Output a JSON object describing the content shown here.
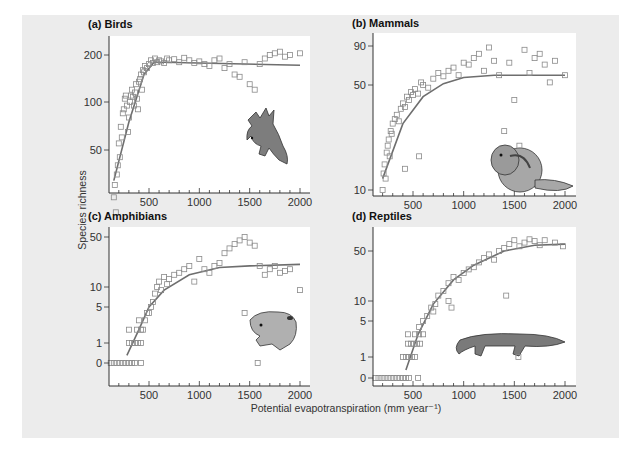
{
  "figure": {
    "ylabel": "Species richness",
    "xlabel": "Potential evapotranspiration (mm year⁻¹)",
    "background": "#ececec",
    "marker_color": "#8a8a8a",
    "fit_color": "#6e6e6e"
  },
  "chart_data": [
    {
      "type": "scatter",
      "title": "(a) Birds",
      "xlabel": "Potential evapotranspiration (mm year-1)",
      "ylabel": "Species richness",
      "x_ticks": [
        500,
        1000,
        1500,
        2000
      ],
      "y_ticks": [
        50,
        100,
        200
      ],
      "xlim": [
        100,
        2100
      ],
      "ylim_scale": "log",
      "grid": false,
      "illustration": "bird",
      "fit_line": {
        "x": [
          150,
          300,
          450,
          550,
          650,
          2000
        ],
        "y": [
          32,
          75,
          150,
          180,
          180,
          172
        ]
      },
      "points": [
        [
          150,
          25
        ],
        [
          160,
          30
        ],
        [
          170,
          20
        ],
        [
          180,
          35
        ],
        [
          190,
          40
        ],
        [
          200,
          55
        ],
        [
          210,
          45
        ],
        [
          220,
          70
        ],
        [
          230,
          60
        ],
        [
          240,
          85
        ],
        [
          250,
          90
        ],
        [
          260,
          105
        ],
        [
          270,
          110
        ],
        [
          280,
          95
        ],
        [
          290,
          65
        ],
        [
          300,
          80
        ],
        [
          310,
          100
        ],
        [
          320,
          110
        ],
        [
          330,
          120
        ],
        [
          340,
          108
        ],
        [
          350,
          95
        ],
        [
          360,
          115
        ],
        [
          370,
          130
        ],
        [
          380,
          105
        ],
        [
          390,
          90
        ],
        [
          400,
          135
        ],
        [
          410,
          140
        ],
        [
          420,
          150
        ],
        [
          430,
          120
        ],
        [
          440,
          160
        ],
        [
          450,
          155
        ],
        [
          460,
          170
        ],
        [
          480,
          165
        ],
        [
          500,
          175
        ],
        [
          520,
          185
        ],
        [
          540,
          178
        ],
        [
          560,
          190
        ],
        [
          580,
          180
        ],
        [
          600,
          185
        ],
        [
          620,
          182
        ],
        [
          650,
          178
        ],
        [
          680,
          190
        ],
        [
          700,
          185
        ],
        [
          750,
          188
        ],
        [
          800,
          180
        ],
        [
          850,
          192
        ],
        [
          900,
          185
        ],
        [
          950,
          178
        ],
        [
          1000,
          182
        ],
        [
          1050,
          175
        ],
        [
          1100,
          170
        ],
        [
          1150,
          185
        ],
        [
          1200,
          190
        ],
        [
          1250,
          165
        ],
        [
          1300,
          175
        ],
        [
          1350,
          150
        ],
        [
          1400,
          145
        ],
        [
          1450,
          180
        ],
        [
          1500,
          130
        ],
        [
          1550,
          120
        ],
        [
          1600,
          175
        ],
        [
          1650,
          190
        ],
        [
          1700,
          200
        ],
        [
          1750,
          205
        ],
        [
          1800,
          210
        ],
        [
          1850,
          195
        ],
        [
          1900,
          200
        ],
        [
          2000,
          205
        ]
      ]
    },
    {
      "type": "scatter",
      "title": "(b) Mammals",
      "x_ticks": [
        500,
        1000,
        1500,
        2000
      ],
      "y_ticks": [
        10,
        50,
        90
      ],
      "xlim": [
        100,
        2100
      ],
      "grid": false,
      "illustration": "chipmunk",
      "fit_line": {
        "x": [
          200,
          400,
          600,
          800,
          1000,
          1300,
          2000
        ],
        "y": [
          12,
          28,
          42,
          51,
          56,
          58,
          58
        ]
      },
      "points": [
        [
          200,
          10
        ],
        [
          210,
          13
        ],
        [
          220,
          15
        ],
        [
          230,
          12
        ],
        [
          240,
          18
        ],
        [
          250,
          20
        ],
        [
          260,
          22
        ],
        [
          270,
          17
        ],
        [
          280,
          25
        ],
        [
          290,
          24
        ],
        [
          300,
          28
        ],
        [
          320,
          30
        ],
        [
          340,
          32
        ],
        [
          360,
          29
        ],
        [
          380,
          35
        ],
        [
          400,
          38
        ],
        [
          420,
          36
        ],
        [
          440,
          42
        ],
        [
          460,
          40
        ],
        [
          480,
          45
        ],
        [
          500,
          43
        ],
        [
          520,
          47
        ],
        [
          550,
          44
        ],
        [
          580,
          52
        ],
        [
          600,
          50
        ],
        [
          650,
          48
        ],
        [
          700,
          55
        ],
        [
          750,
          60
        ],
        [
          800,
          57
        ],
        [
          850,
          62
        ],
        [
          900,
          65
        ],
        [
          950,
          58
        ],
        [
          1000,
          70
        ],
        [
          1050,
          68
        ],
        [
          1100,
          75
        ],
        [
          1150,
          80
        ],
        [
          1200,
          62
        ],
        [
          1250,
          88
        ],
        [
          1300,
          72
        ],
        [
          1350,
          58
        ],
        [
          1400,
          25
        ],
        [
          1450,
          70
        ],
        [
          1500,
          40
        ],
        [
          1550,
          20
        ],
        [
          1600,
          85
        ],
        [
          1650,
          60
        ],
        [
          1700,
          75
        ],
        [
          1750,
          80
        ],
        [
          1800,
          68
        ],
        [
          1850,
          52
        ],
        [
          1900,
          72
        ],
        [
          2000,
          58
        ],
        [
          560,
          17
        ],
        [
          420,
          14
        ]
      ]
    },
    {
      "type": "scatter",
      "title": "(c) Amphibians",
      "x_ticks": [
        500,
        1000,
        1500,
        2000
      ],
      "y_ticks": [
        0,
        1,
        5,
        10,
        50
      ],
      "xlim": [
        100,
        2100
      ],
      "grid": false,
      "illustration": "frog",
      "fit_line": {
        "x": [
          280,
          400,
          500,
          650,
          900,
          1200,
          1500,
          2000
        ],
        "y": [
          0.3,
          2,
          5,
          9,
          15,
          19,
          20,
          21
        ]
      },
      "points": [
        [
          120,
          0
        ],
        [
          150,
          0
        ],
        [
          180,
          0
        ],
        [
          210,
          0
        ],
        [
          240,
          0
        ],
        [
          270,
          0
        ],
        [
          300,
          0
        ],
        [
          330,
          0
        ],
        [
          360,
          0
        ],
        [
          420,
          0
        ],
        [
          300,
          1
        ],
        [
          330,
          1
        ],
        [
          360,
          1
        ],
        [
          390,
          1
        ],
        [
          420,
          1
        ],
        [
          300,
          2
        ],
        [
          380,
          2
        ],
        [
          400,
          3
        ],
        [
          420,
          2
        ],
        [
          440,
          2
        ],
        [
          460,
          3
        ],
        [
          480,
          4
        ],
        [
          500,
          4
        ],
        [
          520,
          5
        ],
        [
          540,
          6
        ],
        [
          560,
          8
        ],
        [
          580,
          10
        ],
        [
          600,
          12
        ],
        [
          620,
          9
        ],
        [
          650,
          14
        ],
        [
          680,
          11
        ],
        [
          700,
          13
        ],
        [
          750,
          15
        ],
        [
          800,
          16
        ],
        [
          850,
          18
        ],
        [
          900,
          20
        ],
        [
          950,
          12
        ],
        [
          1000,
          25
        ],
        [
          1050,
          18
        ],
        [
          1100,
          16
        ],
        [
          1150,
          20
        ],
        [
          1200,
          22
        ],
        [
          1250,
          30
        ],
        [
          1300,
          35
        ],
        [
          1350,
          40
        ],
        [
          1400,
          45
        ],
        [
          1450,
          50
        ],
        [
          1500,
          42
        ],
        [
          1550,
          38
        ],
        [
          1600,
          20
        ],
        [
          1650,
          15
        ],
        [
          1700,
          18
        ],
        [
          1750,
          20
        ],
        [
          1800,
          16
        ],
        [
          1850,
          17
        ],
        [
          1900,
          18
        ],
        [
          2000,
          9
        ],
        [
          1450,
          4
        ],
        [
          1580,
          0
        ]
      ]
    },
    {
      "type": "scatter",
      "title": "(d) Reptiles",
      "x_ticks": [
        500,
        1000,
        1500,
        2000
      ],
      "y_ticks": [
        0,
        1,
        5,
        10,
        50
      ],
      "xlim": [
        100,
        2100
      ],
      "grid": false,
      "illustration": "crocodile",
      "fit_line": {
        "x": [
          430,
          550,
          700,
          900,
          1100,
          1400,
          1700,
          2000
        ],
        "y": [
          0.3,
          3,
          9,
          20,
          32,
          50,
          60,
          62
        ]
      },
      "points": [
        [
          130,
          0
        ],
        [
          160,
          0
        ],
        [
          190,
          0
        ],
        [
          220,
          0
        ],
        [
          250,
          0
        ],
        [
          280,
          0
        ],
        [
          310,
          0
        ],
        [
          340,
          0
        ],
        [
          370,
          0
        ],
        [
          400,
          0
        ],
        [
          430,
          0
        ],
        [
          460,
          0
        ],
        [
          550,
          0
        ],
        [
          400,
          1
        ],
        [
          430,
          1
        ],
        [
          460,
          1
        ],
        [
          490,
          1
        ],
        [
          520,
          1
        ],
        [
          450,
          2
        ],
        [
          480,
          2
        ],
        [
          510,
          2
        ],
        [
          540,
          2
        ],
        [
          570,
          2
        ],
        [
          450,
          3
        ],
        [
          520,
          3
        ],
        [
          560,
          3
        ],
        [
          600,
          3
        ],
        [
          560,
          4
        ],
        [
          600,
          5
        ],
        [
          640,
          6
        ],
        [
          680,
          8
        ],
        [
          700,
          7
        ],
        [
          720,
          9
        ],
        [
          750,
          12
        ],
        [
          800,
          14
        ],
        [
          850,
          18
        ],
        [
          900,
          22
        ],
        [
          950,
          20
        ],
        [
          1000,
          25
        ],
        [
          1050,
          28
        ],
        [
          1100,
          30
        ],
        [
          1150,
          35
        ],
        [
          1200,
          40
        ],
        [
          1250,
          45
        ],
        [
          1300,
          38
        ],
        [
          1350,
          50
        ],
        [
          1400,
          55
        ],
        [
          1450,
          62
        ],
        [
          1500,
          70
        ],
        [
          1550,
          58
        ],
        [
          1600,
          65
        ],
        [
          1650,
          72
        ],
        [
          1700,
          68
        ],
        [
          1750,
          60
        ],
        [
          1800,
          70
        ],
        [
          1900,
          65
        ],
        [
          1980,
          58
        ],
        [
          1420,
          12
        ],
        [
          1540,
          1
        ],
        [
          850,
          10
        ],
        [
          880,
          8
        ]
      ]
    }
  ],
  "panels": [
    {
      "title": "(a) Birds",
      "x_tick_labels": [
        "500",
        "1000",
        "1500",
        "2000"
      ],
      "y_tick_labels": [
        "50",
        "100",
        "200"
      ]
    },
    {
      "title": "(b) Mammals",
      "x_tick_labels": [
        "500",
        "1000",
        "1500",
        "2000"
      ],
      "y_tick_labels": [
        "10",
        "50",
        "90"
      ]
    },
    {
      "title": "(c) Amphibians",
      "x_tick_labels": [
        "500",
        "1000",
        "1500",
        "2000"
      ],
      "y_tick_labels": [
        "0",
        "1",
        "5",
        "10",
        "50"
      ]
    },
    {
      "title": "(d) Reptiles",
      "x_tick_labels": [
        "500",
        "1000",
        "1500",
        "2000"
      ],
      "y_tick_labels": [
        "0",
        "1",
        "5",
        "10",
        "50"
      ]
    }
  ]
}
